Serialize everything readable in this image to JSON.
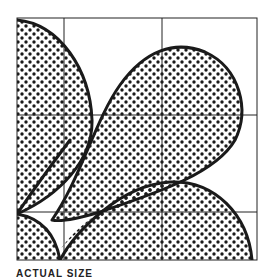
{
  "figure": {
    "colors": {
      "ink": "#1a1a1a",
      "paper": "#ffffff",
      "grid": "#222222",
      "dot": "#1a1a1a"
    },
    "grid": {
      "left": 17,
      "top": 18,
      "right": 257,
      "bottom": 260,
      "verticals": [
        64,
        162
      ],
      "horizontals": [
        115,
        212
      ]
    },
    "shapes": [
      {
        "name": "top-left-quarter-lobe"
      },
      {
        "name": "central-teardrop-lobe"
      },
      {
        "name": "bottom-right-arch-lobe"
      },
      {
        "name": "bottom-left-cusp-region"
      }
    ]
  },
  "caption": {
    "text": "ACTUAL SIZE"
  }
}
